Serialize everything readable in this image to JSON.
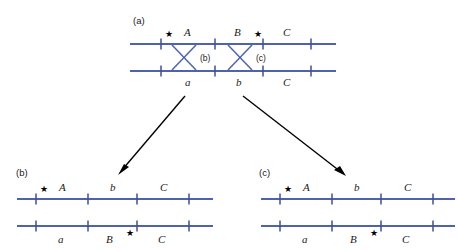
{
  "figure": {
    "background_color": "#ffffff",
    "line_color": "#4f63ad",
    "tick_color": "#3f4f96",
    "arrow_color": "#000000",
    "text_color": "#1a1a1a"
  },
  "panels": {
    "a": {
      "label": "(a)",
      "top_chromosome": {
        "labels": [
          "A",
          "B",
          "C"
        ],
        "star": "★",
        "star_count": 2
      },
      "bottom_chromosome": {
        "labels": [
          "a",
          "b",
          "C"
        ]
      },
      "crossover_labels": [
        "(b)",
        "(c)"
      ]
    },
    "b": {
      "label": "(b)",
      "top_chromosome": {
        "labels": [
          "A",
          "b",
          "C"
        ],
        "star": "★"
      },
      "bottom_chromosome": {
        "labels": [
          "a",
          "B",
          "C"
        ],
        "star": "★"
      }
    },
    "c": {
      "label": "(c)",
      "top_chromosome": {
        "labels": [
          "A",
          "b",
          "C"
        ],
        "star": "★"
      },
      "bottom_chromosome": {
        "labels": [
          "a",
          "B",
          "C"
        ],
        "star": "★"
      }
    }
  },
  "labels": {
    "panel_a": "(a)",
    "panel_b": "(b)",
    "panel_c": "(c)",
    "crossover_b": "(b)",
    "crossover_c": "(c)",
    "star": "★",
    "a_top_A": "A",
    "a_top_B": "B",
    "a_top_C": "C",
    "a_bot_a": "a",
    "a_bot_b": "b",
    "a_bot_C": "C",
    "b_top_A": "A",
    "b_top_b": "b",
    "b_top_C": "C",
    "b_bot_a": "a",
    "b_bot_B": "B",
    "b_bot_C": "C",
    "c_top_A": "A",
    "c_top_b": "b",
    "c_top_C": "C",
    "c_bot_a": "a",
    "c_bot_B": "B",
    "c_bot_C": "C"
  }
}
